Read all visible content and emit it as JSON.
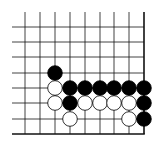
{
  "board": {
    "description": "Go problem diagram, lower-right corner",
    "line_color": "#111111",
    "background": "#ffffff",
    "columns_x": [
      25,
      40,
      55,
      70,
      85,
      100,
      114,
      129,
      144
    ],
    "rows_y": [
      27,
      42,
      57,
      73,
      88,
      103,
      119,
      134
    ],
    "top_y": 12,
    "left_x": 12,
    "right_edge_col": 8,
    "bottom_edge_row": 7,
    "stone_radius": 7.3,
    "stones": [
      {
        "color": "black",
        "col": 2,
        "row": 3
      },
      {
        "color": "white",
        "col": 2,
        "row": 4
      },
      {
        "color": "black",
        "col": 3,
        "row": 4
      },
      {
        "color": "black",
        "col": 4,
        "row": 4
      },
      {
        "color": "black",
        "col": 5,
        "row": 4
      },
      {
        "color": "black",
        "col": 6,
        "row": 4
      },
      {
        "color": "black",
        "col": 7,
        "row": 4
      },
      {
        "color": "black",
        "col": 8,
        "row": 4
      },
      {
        "color": "white",
        "col": 2,
        "row": 5
      },
      {
        "color": "black",
        "col": 3,
        "row": 5
      },
      {
        "color": "white",
        "col": 4,
        "row": 5
      },
      {
        "color": "white",
        "col": 5,
        "row": 5
      },
      {
        "color": "white",
        "col": 6,
        "row": 5
      },
      {
        "color": "white",
        "col": 7,
        "row": 5
      },
      {
        "color": "black",
        "col": 8,
        "row": 5
      },
      {
        "color": "white",
        "col": 3,
        "row": 6
      },
      {
        "color": "white",
        "col": 7,
        "row": 6
      },
      {
        "color": "black",
        "col": 8,
        "row": 6
      }
    ]
  }
}
